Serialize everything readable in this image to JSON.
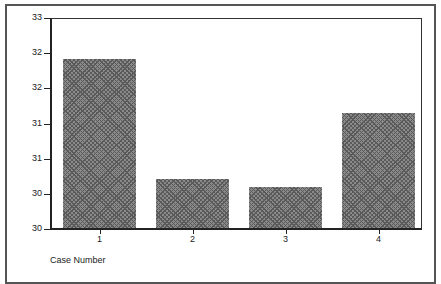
{
  "chart_data": {
    "type": "bar",
    "title": "",
    "xlabel": "Case Number",
    "ylabel": "Value Petroleum",
    "categories": [
      "1",
      "2",
      "3",
      "4"
    ],
    "values": [
      32.4,
      30.69,
      30.59,
      31.63
    ],
    "ylim": [
      30,
      33
    ],
    "ytick_values": [
      30.0,
      30.5,
      31.0,
      31.5,
      32.0,
      32.5,
      33.0
    ],
    "ytick_labels": [
      "30",
      "30",
      "31",
      "31",
      "32",
      "32",
      "33"
    ],
    "grid": false,
    "legend": null,
    "bar_fill": "crosshatch gray"
  },
  "colors": {
    "bar": "#8a8a8a",
    "axis": "#222222",
    "frame": "#555555"
  }
}
